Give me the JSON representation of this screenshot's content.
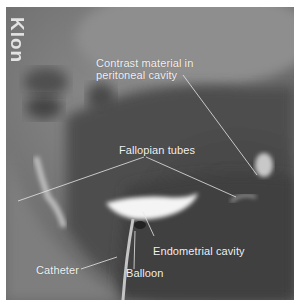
{
  "figure": {
    "type": "hysterosalpingogram radiograph",
    "edge_text": "Klon",
    "colors": {
      "border": "#ffffff",
      "background_gray": "#6e6e6e",
      "dark_region": "#3a3a3a",
      "contrast_white": "#f4f4f4",
      "label_text": "#f2f2f2"
    },
    "labels": {
      "contrast_line1": "Contrast material in",
      "contrast_line2": "peritoneal cavity",
      "fallopian": "Fallopian tubes",
      "endometrial": "Endometrial cavity",
      "catheter": "Catheter",
      "balloon": "Balloon"
    }
  }
}
